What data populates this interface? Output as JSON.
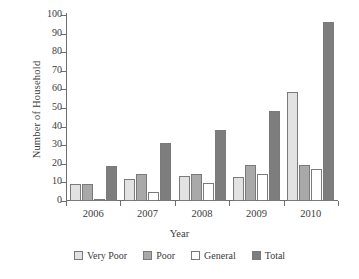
{
  "chart_data": {
    "type": "bar",
    "title": "",
    "subtitle": "",
    "xlabel": "Year",
    "ylabel": "Number of Household",
    "categories": [
      "2006",
      "2007",
      "2008",
      "2009",
      "2010"
    ],
    "series": [
      {
        "name": "Very Poor",
        "color": "#e2e2e2",
        "values": [
          9,
          12,
          13.5,
          13,
          58.5
        ]
      },
      {
        "name": "Poor",
        "color": "#a9a9a9",
        "values": [
          9,
          14.5,
          14.5,
          19.5,
          19.5
        ]
      },
      {
        "name": "General",
        "color": "#ffffff",
        "values": [
          1,
          5,
          9.5,
          14.5,
          17
        ]
      },
      {
        "name": "Total",
        "color": "#7d7d7d",
        "values": [
          19,
          31,
          38,
          48.5,
          96.5
        ]
      }
    ],
    "ylim": [
      0,
      100
    ],
    "ytick_step": 10,
    "yticks": [
      0,
      10,
      20,
      30,
      40,
      50,
      60,
      70,
      80,
      90,
      100
    ],
    "ytick_labels": [
      "0",
      "10",
      "20",
      "30",
      "40",
      "50",
      "60",
      "70",
      "80",
      "90",
      "100"
    ],
    "grid": false,
    "legend_position": "bottom",
    "bar_outline_color": "#7a7a7a",
    "axis_color": "#6e6e6e",
    "text_color": "#3b3b3b",
    "background": "#ffffff"
  }
}
